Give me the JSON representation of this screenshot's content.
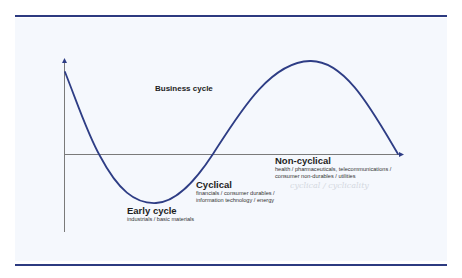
{
  "diagram": {
    "title": "Business cycle",
    "type": "business-cycle-sine-curve",
    "colors": {
      "rule": "#2c3a80",
      "curve": "#2e3d85",
      "axis": "#707070",
      "panel_background": "#f5f8fd",
      "text": "#1e1e1e"
    },
    "phases": [
      {
        "name": "Early cycle",
        "sectors": [
          "industrials / basic materials"
        ]
      },
      {
        "name": "Cyclical",
        "sectors": [
          "financials / consumer durables /",
          "information technology / energy"
        ]
      },
      {
        "name": "Non-cyclical",
        "sectors": [
          "health / pharmaceuticals, telecommunications /",
          "consumer non-durables / utilities"
        ]
      }
    ],
    "handwritten_note": "cyclical / cyclicality"
  }
}
